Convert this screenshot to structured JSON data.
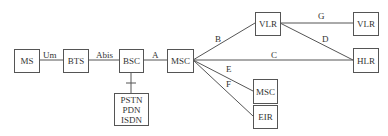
{
  "nodes": {
    "ms": "MS",
    "bts": "BTS",
    "bsc": "BSC",
    "msc": "MSC",
    "pstn": "PSTN\nPDN\nISDN",
    "vlr1": "VLR",
    "vlr2": "VLR",
    "hlr": "HLR",
    "msc2": "MSC",
    "eir": "EIR"
  },
  "interfaces": {
    "um": "Um",
    "abis": "Abis",
    "a": "A",
    "b": "B",
    "c": "C",
    "d": "D",
    "e": "E",
    "f": "F",
    "g": "G"
  }
}
